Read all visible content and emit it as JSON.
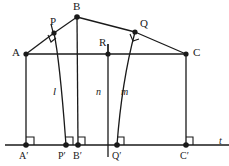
{
  "figure": {
    "type": "geometry-diagram",
    "background_color": "#ffffff",
    "stroke_color": "#1a1a1a",
    "points": [
      {
        "id": "A",
        "label": "A",
        "x": 26,
        "y": 54,
        "label_x": 12,
        "label_y": 48,
        "dot": true
      },
      {
        "id": "P",
        "label": "P",
        "x": 54,
        "y": 33,
        "label_x": 50,
        "label_y": 17,
        "dot": true
      },
      {
        "id": "B",
        "label": "B",
        "x": 77,
        "y": 17,
        "label_x": 73,
        "label_y": 2,
        "dot": true
      },
      {
        "id": "Q",
        "label": "Q",
        "x": 135,
        "y": 32,
        "label_x": 140,
        "label_y": 19,
        "dot": true
      },
      {
        "id": "R",
        "label": "R",
        "x": 108,
        "y": 54,
        "label_x": 99,
        "label_y": 38,
        "dot": true
      },
      {
        "id": "C",
        "label": "C",
        "x": 186,
        "y": 54,
        "label_x": 193,
        "label_y": 48,
        "dot": true
      },
      {
        "id": "Ap",
        "label": "A′",
        "x": 26,
        "y": 145,
        "label_x": 19,
        "label_y": 152,
        "dot": true
      },
      {
        "id": "Pp",
        "label": "P′",
        "x": 66,
        "y": 145,
        "label_x": 59,
        "label_y": 152,
        "dot": true
      },
      {
        "id": "Bp",
        "label": "B′",
        "x": 78,
        "y": 145,
        "label_x": 74,
        "label_y": 152,
        "dot": true
      },
      {
        "id": "Qp",
        "label": "Q′",
        "x": 117,
        "y": 145,
        "label_x": 113,
        "label_y": 152,
        "dot": true
      },
      {
        "id": "Cp",
        "label": "C′",
        "x": 186,
        "y": 145,
        "label_x": 180,
        "label_y": 152,
        "dot": true
      }
    ],
    "curve_labels": [
      {
        "id": "l",
        "label": "l",
        "x": 54,
        "y": 92
      },
      {
        "id": "n",
        "label": "n",
        "x": 97,
        "y": 92
      },
      {
        "id": "m",
        "label": "m",
        "x": 122,
        "y": 92
      }
    ],
    "axis_label": {
      "label": "t",
      "x": 219,
      "y": 138
    },
    "segments": [
      {
        "id": "A-P",
        "from": "A",
        "to": "P"
      },
      {
        "id": "P-B",
        "from": "P",
        "to": "B"
      },
      {
        "id": "B-Q",
        "from": "B",
        "to": "Q"
      },
      {
        "id": "Q-C",
        "from": "Q",
        "to": "C"
      },
      {
        "id": "A-C",
        "from": "A",
        "to": "C"
      },
      {
        "id": "A-Ap",
        "from": "A",
        "to": "Ap"
      },
      {
        "id": "B-Bp",
        "from": "B",
        "to": "Bp"
      },
      {
        "id": "C-Cp",
        "from": "C",
        "to": "Cp"
      }
    ],
    "axis": {
      "x1": 5,
      "y1": 145,
      "x2": 229,
      "y2": 145
    },
    "right_angle_marks": [
      {
        "id": "angle-at-P",
        "x": 54,
        "y": 33
      },
      {
        "id": "angle-at-Q",
        "x": 135,
        "y": 32
      },
      {
        "id": "angle-at-Ap",
        "x": 26,
        "y": 145
      },
      {
        "id": "angle-at-Pp",
        "x": 66,
        "y": 145
      },
      {
        "id": "angle-at-Bp",
        "x": 78,
        "y": 145
      },
      {
        "id": "angle-at-Qp",
        "x": 117,
        "y": 145
      },
      {
        "id": "angle-at-Cp",
        "x": 186,
        "y": 145
      }
    ],
    "curves": [
      {
        "id": "curve-l",
        "from": "P",
        "to": "Pp",
        "note": "slightly bowed arc from P down to P-prime"
      },
      {
        "id": "curve-n",
        "from": "R",
        "to": "Qp-area",
        "note": "straight vertical line through R"
      },
      {
        "id": "curve-m",
        "from": "Q",
        "to": "Qp",
        "note": "slightly bowed arc from Q down to Q-prime"
      }
    ],
    "tick_marks": [
      {
        "id": "tick-above-P",
        "x": 52,
        "y": 27
      },
      {
        "id": "tick-above-R",
        "x": 108,
        "y": 44
      }
    ]
  }
}
